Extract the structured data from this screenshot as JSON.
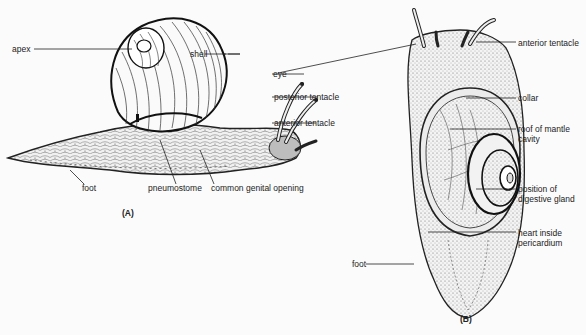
{
  "figure": {
    "panels": [
      {
        "id": "A",
        "panel_label": "(A)",
        "view": "side view of snail",
        "labels": {
          "apex": "apex",
          "shell": "shell",
          "eye": "eye",
          "posterior_tentacle": "posterior tentacle",
          "anterior_tentacle": "anterior tentacle",
          "foot": "foot",
          "pneumostome": "pneumostome",
          "genital_opening": "common genital opening"
        }
      },
      {
        "id": "B",
        "panel_label": "(B)",
        "view": "dorsal view of snail with shell removed",
        "labels": {
          "anterior_tentacle": "anterior tentacle",
          "collar": "collar",
          "mantle_roof_1": "roof of mantle",
          "mantle_roof_2": "cavity",
          "digestive_1": "position of",
          "digestive_2": "digestive gland",
          "heart_1": "heart inside",
          "heart_2": "pericardium",
          "foot": "foot"
        }
      }
    ]
  }
}
